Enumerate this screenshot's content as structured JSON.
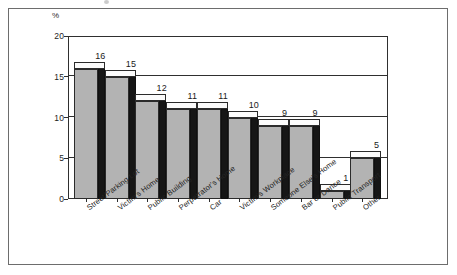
{
  "figure": {
    "axis_unit_label": "%",
    "frame_color": "#6d6d6d",
    "bar_front_color": "#b3b3b3",
    "bar_side_color": "#161616",
    "bar_top_color": "#fbfbfb",
    "axis_color": "#2f2f2f"
  },
  "chart_data": {
    "type": "bar",
    "title": "",
    "subtitle": "",
    "xlabel": "",
    "ylabel": "%",
    "ylim": [
      0,
      20
    ],
    "yticks": [
      0,
      5,
      10,
      15,
      20
    ],
    "ytick_labels": [
      "0",
      "5",
      "10",
      "15",
      "20"
    ],
    "grid": true,
    "grid_axis": "y",
    "legend": false,
    "legend_position": "none",
    "data_labels": true,
    "style": "3d-bar",
    "categories": [
      "Street/Parking Lot",
      "Victim's Home",
      "Public Building",
      "Perpetrator's Home",
      "Car",
      "Victim's Workplace",
      "Someone Else's Home",
      "Bar or Dance",
      "Public Transport",
      "Other"
    ],
    "values": [
      16,
      15,
      12,
      11,
      11,
      10,
      9,
      9,
      1,
      5
    ],
    "value_labels": [
      "16",
      "15",
      "12",
      "11",
      "11",
      "10",
      "9",
      "9",
      "1",
      "5"
    ]
  }
}
